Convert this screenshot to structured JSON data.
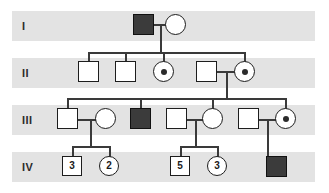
{
  "figure": {
    "type": "pedigree-chart",
    "title": "",
    "width": 329,
    "height": 193,
    "background_color": "#ffffff",
    "band_color": "#e3e3e3",
    "line_color": "#3a3a3a",
    "symbol_stroke_color": "#1d1d1d",
    "affected_fill_color": "#3b3b3b",
    "unaffected_fill_color": "#ffffff",
    "carrier_dot_color": "#2b2b2b"
  },
  "generations": [
    {
      "label": "I",
      "band_top": 11,
      "row_center": 26
    },
    {
      "label": "II",
      "band_top": 58,
      "row_center": 73
    },
    {
      "label": "III",
      "band_top": 105,
      "row_center": 120
    },
    {
      "label": "IV",
      "band_top": 152,
      "row_center": 167
    }
  ],
  "symbols": [
    {
      "id": "I-1",
      "generation": "I",
      "shape": "square",
      "status": "affected",
      "sex": "male",
      "label": "",
      "x": 133,
      "y": 14,
      "size": 21
    },
    {
      "id": "I-2",
      "generation": "I",
      "shape": "circle",
      "status": "unaffected",
      "sex": "female",
      "label": "",
      "x": 165,
      "y": 14,
      "size": 21
    },
    {
      "id": "II-1",
      "generation": "II",
      "shape": "square",
      "status": "unaffected",
      "sex": "male",
      "label": "",
      "x": 78,
      "y": 61,
      "size": 21
    },
    {
      "id": "II-2",
      "generation": "II",
      "shape": "square",
      "status": "unaffected",
      "sex": "male",
      "label": "",
      "x": 115,
      "y": 61,
      "size": 21
    },
    {
      "id": "II-3",
      "generation": "II",
      "shape": "circle",
      "status": "carrier",
      "sex": "female",
      "label": "",
      "x": 153,
      "y": 61,
      "size": 21
    },
    {
      "id": "II-4",
      "generation": "II",
      "shape": "square",
      "status": "unaffected",
      "sex": "male",
      "label": "",
      "x": 196,
      "y": 61,
      "size": 21
    },
    {
      "id": "II-5",
      "generation": "II",
      "shape": "circle",
      "status": "carrier",
      "sex": "female",
      "label": "",
      "x": 234,
      "y": 61,
      "size": 21
    },
    {
      "id": "III-1",
      "generation": "III",
      "shape": "square",
      "status": "unaffected",
      "sex": "male",
      "label": "",
      "x": 57,
      "y": 108,
      "size": 21
    },
    {
      "id": "III-2",
      "generation": "III",
      "shape": "circle",
      "status": "unaffected",
      "sex": "female",
      "label": "",
      "x": 95,
      "y": 108,
      "size": 21
    },
    {
      "id": "III-3",
      "generation": "III",
      "shape": "square",
      "status": "affected",
      "sex": "male",
      "label": "",
      "x": 130,
      "y": 108,
      "size": 21
    },
    {
      "id": "III-4",
      "generation": "III",
      "shape": "square",
      "status": "unaffected",
      "sex": "male",
      "label": "",
      "x": 166,
      "y": 108,
      "size": 21
    },
    {
      "id": "III-5",
      "generation": "III",
      "shape": "circle",
      "status": "unaffected",
      "sex": "female",
      "label": "",
      "x": 202,
      "y": 108,
      "size": 21
    },
    {
      "id": "III-6",
      "generation": "III",
      "shape": "square",
      "status": "unaffected",
      "sex": "male",
      "label": "",
      "x": 238,
      "y": 108,
      "size": 21
    },
    {
      "id": "III-7",
      "generation": "III",
      "shape": "circle",
      "status": "carrier",
      "sex": "female",
      "label": "",
      "x": 275,
      "y": 108,
      "size": 21
    },
    {
      "id": "IV-1",
      "generation": "IV",
      "shape": "square",
      "status": "unaffected",
      "sex": "male",
      "label": "3",
      "x": 62,
      "y": 156,
      "size": 20
    },
    {
      "id": "IV-2",
      "generation": "IV",
      "shape": "circle",
      "status": "unaffected",
      "sex": "female",
      "label": "2",
      "x": 99,
      "y": 156,
      "size": 20
    },
    {
      "id": "IV-3",
      "generation": "IV",
      "shape": "square",
      "status": "unaffected",
      "sex": "male",
      "label": "5",
      "x": 170,
      "y": 156,
      "size": 20
    },
    {
      "id": "IV-4",
      "generation": "IV",
      "shape": "circle",
      "status": "unaffected",
      "sex": "female",
      "label": "3",
      "x": 207,
      "y": 156,
      "size": 20
    },
    {
      "id": "IV-5",
      "generation": "IV",
      "shape": "square",
      "status": "affected",
      "sex": "male",
      "label": "",
      "x": 266,
      "y": 156,
      "size": 21
    }
  ],
  "connectors": {
    "horizontal": [
      {
        "id": "mating-I",
        "x": 154,
        "y": 24,
        "w": 12
      },
      {
        "id": "sibship-II",
        "x": 88,
        "y": 52,
        "w": 156
      },
      {
        "id": "mating-II-4-5",
        "x": 217,
        "y": 71,
        "w": 18
      },
      {
        "id": "sibship-III",
        "x": 67,
        "y": 98,
        "w": 219
      },
      {
        "id": "mating-III-1-2",
        "x": 78,
        "y": 119,
        "w": 18
      },
      {
        "id": "mating-III-4-5",
        "x": 187,
        "y": 119,
        "w": 16
      },
      {
        "id": "mating-III-6-7",
        "x": 259,
        "y": 119,
        "w": 17
      },
      {
        "id": "sibship-IV-a",
        "x": 72,
        "y": 146,
        "w": 37
      },
      {
        "id": "sibship-IV-b",
        "x": 180,
        "y": 146,
        "w": 37
      }
    ],
    "vertical": [
      {
        "id": "drop-I-to-II",
        "x": 160,
        "y": 24,
        "h": 28
      },
      {
        "id": "stem-II-1",
        "x": 88,
        "y": 52,
        "h": 10
      },
      {
        "id": "stem-II-2",
        "x": 125,
        "y": 52,
        "h": 10
      },
      {
        "id": "stem-II-3",
        "x": 163,
        "y": 52,
        "h": 10
      },
      {
        "id": "stem-II-5",
        "x": 244,
        "y": 52,
        "h": 10
      },
      {
        "id": "drop-II-to-III",
        "x": 226,
        "y": 71,
        "h": 28
      },
      {
        "id": "stem-III-1",
        "x": 67,
        "y": 98,
        "h": 11
      },
      {
        "id": "stem-III-3",
        "x": 140,
        "y": 98,
        "h": 11
      },
      {
        "id": "stem-III-5",
        "x": 212,
        "y": 98,
        "h": 11
      },
      {
        "id": "stem-III-7",
        "x": 285,
        "y": 98,
        "h": 11
      },
      {
        "id": "drop-III-a-to-IV",
        "x": 90,
        "y": 119,
        "h": 28
      },
      {
        "id": "drop-III-b-to-IV",
        "x": 195,
        "y": 119,
        "h": 28
      },
      {
        "id": "drop-III-c-to-IV",
        "x": 267,
        "y": 119,
        "h": 38
      },
      {
        "id": "stem-IV-1",
        "x": 72,
        "y": 146,
        "h": 11
      },
      {
        "id": "stem-IV-2",
        "x": 109,
        "y": 146,
        "h": 11
      },
      {
        "id": "stem-IV-3",
        "x": 180,
        "y": 146,
        "h": 11
      },
      {
        "id": "stem-IV-4",
        "x": 217,
        "y": 146,
        "h": 11
      }
    ]
  }
}
